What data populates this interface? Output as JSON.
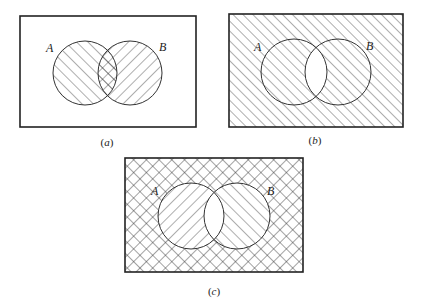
{
  "figure": {
    "panels": [
      {
        "id": "a",
        "caption_open": "(",
        "caption_letter": "a",
        "caption_close": ")",
        "set_a_label": "A",
        "set_b_label": "B",
        "shading": "A hatched /, B hatched \\, intersection cross-hatched (A ∪ B, showing A ∩ B)"
      },
      {
        "id": "b",
        "caption_open": "(",
        "caption_letter": "b",
        "caption_close": ")",
        "set_a_label": "A",
        "set_b_label": "B",
        "shading": "Everything hatched / except intersection (complement of A ∩ B)"
      },
      {
        "id": "c",
        "caption_open": "(",
        "caption_letter": "c",
        "caption_close": ")",
        "set_a_label": "A",
        "set_b_label": "B",
        "shading": "Outside cross-hatched, A only hatched \\, B only hatched /, intersection blank"
      }
    ]
  }
}
